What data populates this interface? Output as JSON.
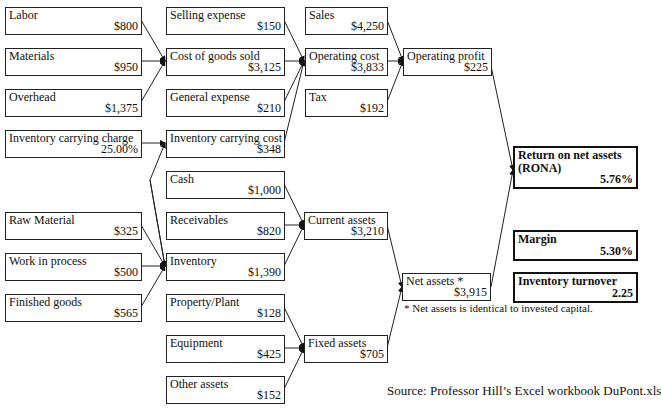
{
  "diagram": {
    "boxes": {
      "labor": {
        "label": "Labor",
        "value": "$800"
      },
      "materials": {
        "label": "Materials",
        "value": "$950"
      },
      "overhead": {
        "label": "Overhead",
        "value": "$1,375"
      },
      "inventory_carrying_charge": {
        "label": "Inventory carrying charge",
        "value": "25.00%"
      },
      "raw_material": {
        "label": "Raw Material",
        "value": "$325"
      },
      "work_in_process": {
        "label": "Work in process",
        "value": "$500"
      },
      "finished_goods": {
        "label": "Finished goods",
        "value": "$565"
      },
      "selling_expense": {
        "label": "Selling expense",
        "value": "$150"
      },
      "cost_of_goods_sold": {
        "label": "Cost of goods sold",
        "value": "$3,125"
      },
      "general_expense": {
        "label": "General expense",
        "value": "$210"
      },
      "inventory_carrying_cost": {
        "label": "Inventory carrying cost",
        "value": "$348"
      },
      "cash": {
        "label": "Cash",
        "value": "$1,000"
      },
      "receivables": {
        "label": "Receivables",
        "value": "$820"
      },
      "inventory": {
        "label": "Inventory",
        "value": "$1,390"
      },
      "property_plant": {
        "label": "Property/Plant",
        "value": "$128"
      },
      "equipment": {
        "label": "Equipment",
        "value": "$425"
      },
      "other_assets": {
        "label": "Other assets",
        "value": "$152"
      },
      "sales": {
        "label": "Sales",
        "value": "$4,250"
      },
      "operating_cost": {
        "label": "Operating cost",
        "value": "$3,833"
      },
      "tax": {
        "label": "Tax",
        "value": "$192"
      },
      "current_assets": {
        "label": "Current assets",
        "value": "$3,210"
      },
      "fixed_assets": {
        "label": "Fixed assets",
        "value": "$705"
      },
      "operating_profit": {
        "label": "Operating profit",
        "value": "$225"
      },
      "net_assets": {
        "label": "Net assets *",
        "value": "$3,915"
      },
      "rona": {
        "label": "Return on net assets (RONA)",
        "value": "5.76%"
      },
      "margin": {
        "label": "Margin",
        "value": "5.30%"
      },
      "inventory_turnover": {
        "label": "Inventory turnover",
        "value": "2.25"
      }
    },
    "footnote": "* Net assets is identical to invested capital.",
    "source": "Source:  Professor Hill’s Excel workbook DuPont.xls",
    "line_color": "#222222"
  }
}
